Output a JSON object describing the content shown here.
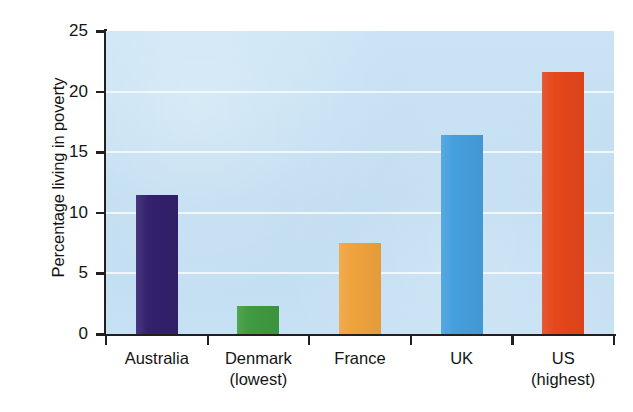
{
  "chart_data": {
    "type": "bar",
    "title": "",
    "xlabel": "",
    "ylabel": "Percentage living in poverty",
    "categories": [
      "Australia",
      "Denmark",
      "France",
      "UK",
      "US"
    ],
    "category_sublabels": [
      "",
      "(lowest)",
      "",
      "",
      "(highest)"
    ],
    "values": [
      11.5,
      2.3,
      7.5,
      16.4,
      21.6
    ],
    "ylim": [
      0,
      25
    ],
    "yticks": [
      0,
      5,
      10,
      15,
      20,
      25
    ],
    "ytick_labels": [
      "0",
      "5",
      "10",
      "15",
      "20",
      "25"
    ],
    "grid": true,
    "legend": "none",
    "bar_colors": [
      "#33206e",
      "#3f9a40",
      "#efa33c",
      "#459fdd",
      "#e5471b"
    ],
    "plot_background": "#c2dff2",
    "axis_color": "#231f20",
    "gridline_color": "#f3f9fd",
    "series": [
      {
        "name": "Percentage living in poverty",
        "values": [
          11.5,
          2.3,
          7.5,
          16.4,
          21.6
        ]
      }
    ]
  }
}
